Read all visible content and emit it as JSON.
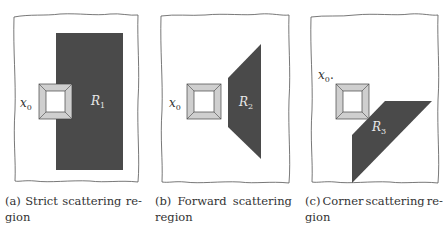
{
  "figure": {
    "panels": [
      {
        "id": "a",
        "caption_line1_words": [
          "(a)",
          "Strict",
          "scattering",
          "re-"
        ],
        "caption_line2": "gion",
        "point_label": "x",
        "point_subscript": "0",
        "region_label": "R",
        "region_subscript": "1"
      },
      {
        "id": "b",
        "caption_line1_words": [
          "(b)",
          "Forward",
          "scattering"
        ],
        "caption_line2": "region",
        "point_label": "x",
        "point_subscript": "0",
        "region_label": "R",
        "region_subscript": "2"
      },
      {
        "id": "c",
        "caption_line1_words": [
          "(c)",
          "Corner",
          "scattering",
          "re-"
        ],
        "caption_line2": "gion",
        "point_label": "x",
        "point_subscript": "0",
        "point_suffix": ".",
        "region_label": "R",
        "region_subscript": "3"
      }
    ],
    "colors": {
      "region_fill": "#4a4a4a",
      "scatterer_outer": "#cfcfcf",
      "scatterer_inner": "#ffffff",
      "frame_stroke": "#555555"
    }
  }
}
